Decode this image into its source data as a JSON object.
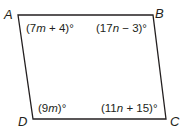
{
  "figure": {
    "type": "quadrilateral (parallelogram)",
    "stroke_color": "#231f20",
    "vertices": [
      {
        "name": "A",
        "x": 18,
        "y": 15
      },
      {
        "name": "B",
        "x": 153,
        "y": 15
      },
      {
        "name": "C",
        "x": 166,
        "y": 119
      },
      {
        "name": "D",
        "x": 33,
        "y": 119
      }
    ],
    "labels": {
      "A": "A",
      "B": "B",
      "C": "C",
      "D": "D"
    },
    "angles": {
      "A": {
        "pre": "(7",
        "var": "m",
        "post": " + 4)°"
      },
      "B": {
        "pre": "(17",
        "var": "n",
        "post": " − 3)°"
      },
      "D": {
        "pre": "(9",
        "var": "m",
        "post": ")°"
      },
      "C": {
        "pre": "(11",
        "var": "n",
        "post": " + 15)°"
      }
    }
  }
}
